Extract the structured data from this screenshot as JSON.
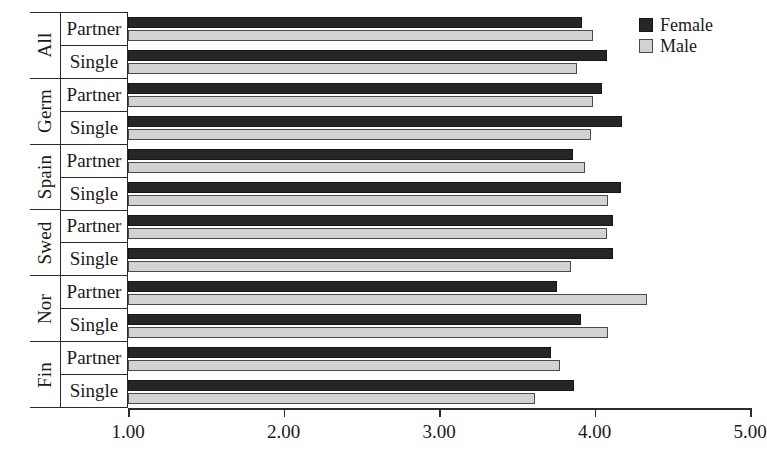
{
  "chart_data": {
    "type": "bar",
    "orientation": "horizontal",
    "title": "",
    "xlabel": "",
    "ylabel": "",
    "xlim": [
      1.0,
      5.0
    ],
    "grid": false,
    "legend_position": "top-right",
    "tick_labels": [
      "1.00",
      "2.00",
      "3.00",
      "4.00",
      "5.00"
    ],
    "tick_values": [
      1.0,
      2.0,
      3.0,
      4.0,
      5.0
    ],
    "legend": [
      {
        "name": "Female",
        "color": "#262626"
      },
      {
        "name": "Male",
        "color": "#d2d2d2"
      }
    ],
    "group_label_level1": [
      "All",
      "Germ",
      "Spain",
      "Swed",
      "Nor",
      "Fin"
    ],
    "group_label_level2": [
      "Partner",
      "Single"
    ],
    "categories": [
      "All / Partner",
      "All / Single",
      "Germ / Partner",
      "Germ / Single",
      "Spain / Partner",
      "Spain / Single",
      "Swed / Partner",
      "Swed / Single",
      "Nor / Partner",
      "Nor / Single",
      "Fin / Partner",
      "Fin / Single"
    ],
    "series": [
      {
        "name": "Female",
        "values": [
          3.92,
          4.08,
          4.05,
          4.18,
          3.86,
          4.17,
          4.12,
          4.12,
          3.76,
          3.91,
          3.72,
          3.87
        ]
      },
      {
        "name": "Male",
        "values": [
          3.99,
          3.89,
          3.99,
          3.98,
          3.94,
          4.09,
          4.08,
          3.85,
          4.34,
          4.09,
          3.78,
          3.62
        ]
      }
    ]
  },
  "axis": {
    "countries": [
      {
        "label": "All"
      },
      {
        "label": "Germ"
      },
      {
        "label": "Spain"
      },
      {
        "label": "Swed"
      },
      {
        "label": "Nor"
      },
      {
        "label": "Fin"
      }
    ],
    "statuses": [
      {
        "label": "Partner"
      },
      {
        "label": "Single"
      },
      {
        "label": "Partner"
      },
      {
        "label": "Single"
      },
      {
        "label": "Partner"
      },
      {
        "label": "Single"
      },
      {
        "label": "Partner"
      },
      {
        "label": "Single"
      },
      {
        "label": "Partner"
      },
      {
        "label": "Single"
      },
      {
        "label": "Partner"
      },
      {
        "label": "Single"
      }
    ]
  },
  "colors": {
    "female": "#262626",
    "male": "#d2d2d2",
    "axis": "#2b2b2b",
    "background": "#ffffff"
  }
}
